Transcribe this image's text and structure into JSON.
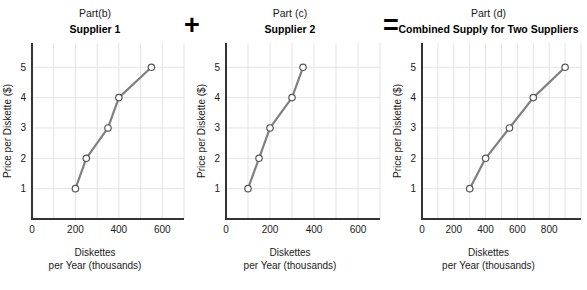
{
  "figure": {
    "operators": {
      "plus": "+",
      "equals": "="
    }
  },
  "panels": [
    {
      "part": "Part(b)",
      "title": "Supplier 1",
      "ylabel": "Price per Diskette ($)",
      "xlabel_line1": "Diskettes",
      "xlabel_line2": "per Year (thousands)",
      "xticks": [
        "0",
        "200",
        "400",
        "600"
      ],
      "yticks": [
        "1",
        "2",
        "3",
        "4",
        "5"
      ]
    },
    {
      "part": "Part (c)",
      "title": "Supplier 2",
      "ylabel": "Price per Diskette ($)",
      "xlabel_line1": "Diskettes",
      "xlabel_line2": "per Year (thousands)",
      "xticks": [
        "0",
        "200",
        "400",
        "600"
      ],
      "yticks": [
        "1",
        "2",
        "3",
        "4",
        "5"
      ]
    },
    {
      "part": "Part (d)",
      "title": "Combined Supply for Two Suppliers",
      "ylabel": "Price per Diskette ($)",
      "xlabel_line1": "Diskettes",
      "xlabel_line2": "per Year (thousands)",
      "xticks": [
        "0",
        "200",
        "400",
        "600",
        "800"
      ],
      "yticks": [
        "1",
        "2",
        "3",
        "4",
        "5"
      ]
    }
  ],
  "colors": {
    "line": "#808080",
    "marker_fill": "#ffffff",
    "marker_stroke": "#555555",
    "grid": "#e3e3e3",
    "axis": "#333333",
    "text": "#1a1a1a"
  },
  "chart_data": [
    {
      "type": "line",
      "title": "Supplier 1",
      "subtitle": "Part(b)",
      "xlabel": "Diskettes per Year (thousands)",
      "ylabel": "Price per Diskette ($)",
      "x": [
        200,
        250,
        350,
        400,
        550
      ],
      "values": [
        1,
        2,
        3,
        4,
        5
      ],
      "xlim": [
        0,
        700
      ],
      "ylim": [
        0,
        5.8
      ],
      "xticks": [
        0,
        200,
        400,
        600
      ],
      "yticks": [
        1,
        2,
        3,
        4,
        5
      ],
      "grid": true,
      "legend": "none",
      "markers": "open-circle"
    },
    {
      "type": "line",
      "title": "Supplier 2",
      "subtitle": "Part (c)",
      "xlabel": "Diskettes per Year (thousands)",
      "ylabel": "Price per Diskette ($)",
      "x": [
        100,
        150,
        200,
        300,
        350
      ],
      "values": [
        1,
        2,
        3,
        4,
        5
      ],
      "xlim": [
        0,
        700
      ],
      "ylim": [
        0,
        5.8
      ],
      "xticks": [
        0,
        200,
        400,
        600
      ],
      "yticks": [
        1,
        2,
        3,
        4,
        5
      ],
      "grid": true,
      "legend": "none",
      "markers": "open-circle"
    },
    {
      "type": "line",
      "title": "Combined Supply for Two Suppliers",
      "subtitle": "Part (d)",
      "xlabel": "Diskettes per Year (thousands)",
      "ylabel": "Price per Diskette ($)",
      "x": [
        300,
        400,
        550,
        700,
        900
      ],
      "values": [
        1,
        2,
        3,
        4,
        5
      ],
      "xlim": [
        0,
        1000
      ],
      "ylim": [
        0,
        5.8
      ],
      "xticks": [
        0,
        200,
        400,
        600,
        800
      ],
      "yticks": [
        1,
        2,
        3,
        4,
        5
      ],
      "grid": true,
      "legend": "none",
      "markers": "open-circle"
    }
  ]
}
